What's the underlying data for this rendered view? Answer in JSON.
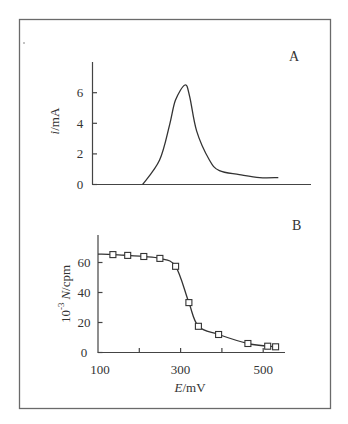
{
  "figure": {
    "panel_a_label": "A",
    "panel_b_label": "B"
  },
  "chart_data": [
    {
      "panel": "A",
      "type": "line",
      "title": "",
      "xlabel": "",
      "ylabel_italic": "i",
      "ylabel_unit": "/mA",
      "ylabel": "i/mA",
      "yticks": [
        0,
        2,
        4,
        6
      ],
      "ylim": [
        0,
        7.5
      ],
      "xticks": [],
      "x_note": "E/mV (shared with panel B, not labeled)",
      "xlim": [
        100,
        630
      ],
      "grid": false,
      "legend": null,
      "series": [
        {
          "name": "i",
          "x": [
            222,
            263,
            287,
            301,
            324,
            335,
            352,
            383,
            407,
            455,
            504,
            549
          ],
          "y": [
            0,
            1.6,
            3.9,
            5.5,
            6.5,
            5.8,
            3.5,
            1.6,
            0.9,
            0.65,
            0.45,
            0.45
          ]
        }
      ]
    },
    {
      "panel": "B",
      "type": "line",
      "title": "",
      "xlabel_italic": "E",
      "xlabel_unit": "/mV",
      "xlabel": "E/mV",
      "ylabel_prefix": "10",
      "ylabel_sup": "-3",
      "ylabel_italic": "N",
      "ylabel_unit": "/cpm",
      "ylabel": "10^-3 N/cpm",
      "xticks": [
        100,
        200,
        300,
        400,
        500
      ],
      "xtick_labels": [
        "100",
        "",
        "300",
        "",
        "500"
      ],
      "yticks": [
        0,
        20,
        40,
        60
      ],
      "xlim": [
        100,
        545
      ],
      "ylim": [
        0,
        78
      ],
      "grid": false,
      "legend": null,
      "series": [
        {
          "name": "N",
          "marker": "square-open",
          "x": [
            136,
            172,
            211,
            250,
            288,
            320,
            343,
            392,
            463,
            511,
            530
          ],
          "y": [
            65.3,
            64.7,
            64.0,
            62.7,
            57.5,
            33.3,
            17.5,
            12.0,
            6.0,
            4.2,
            3.8
          ]
        }
      ]
    }
  ]
}
